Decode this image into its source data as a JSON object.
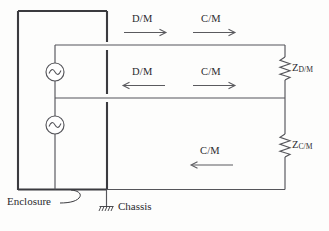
{
  "diagram": {
    "type": "circuit-schematic",
    "colors": {
      "wire": "#55555a",
      "enclosure": "#3b3b3f",
      "text": "#2a2a2e",
      "background": "#fdfdfc"
    },
    "sources": [
      {
        "name": "source-top",
        "symbol": "ac-source",
        "glyph": "~"
      },
      {
        "name": "source-bottom",
        "symbol": "ac-source",
        "glyph": "~"
      }
    ],
    "flow_labels": [
      {
        "id": "top-dm",
        "text": "D/M",
        "direction": "right"
      },
      {
        "id": "top-cm",
        "text": "C/M",
        "direction": "right"
      },
      {
        "id": "mid-dm",
        "text": "D/M",
        "direction": "left"
      },
      {
        "id": "mid-cm",
        "text": "C/M",
        "direction": "right"
      },
      {
        "id": "bottom-cm",
        "text": "C/M",
        "direction": "left"
      }
    ],
    "impedances": [
      {
        "id": "z-dm",
        "symbol": "Z",
        "subscript": "D/M"
      },
      {
        "id": "z-cm",
        "symbol": "Z",
        "subscript": "C/M"
      }
    ],
    "captions": {
      "enclosure": "Enclosure",
      "chassis": "Chassis"
    }
  }
}
